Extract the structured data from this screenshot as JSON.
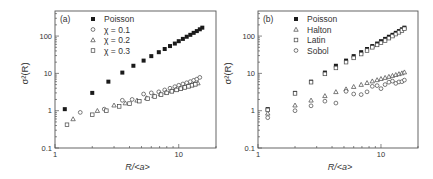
{
  "chart_data": [
    {
      "type": "scatter",
      "panel_label": "(a)",
      "xlabel": "R/<a>",
      "ylabel": "σ²(R)",
      "xscale": "log",
      "yscale": "log",
      "xlim": [
        1,
        20
      ],
      "ylim": [
        0.1,
        470
      ],
      "xticks": [
        1,
        10
      ],
      "xtick_labels": [
        "1",
        "10"
      ],
      "yticks": [
        0.1,
        1,
        10,
        100
      ],
      "ytick_labels": [
        "0.1",
        "1",
        "10",
        "100"
      ],
      "grid": false,
      "legend_position": "upper left",
      "series": [
        {
          "name": "Poisson",
          "marker": "filled-square",
          "x": [
            1.2,
            2.0,
            2.7,
            3.5,
            4.3,
            5.2,
            6.0,
            6.9,
            7.7,
            8.5,
            9.3,
            10.0,
            10.8,
            11.6,
            12.4,
            13.2,
            14.0,
            14.8,
            15.5
          ],
          "y": [
            1.1,
            3.0,
            6.0,
            10.5,
            16,
            22,
            29,
            37,
            45,
            54,
            63,
            73,
            84,
            96,
            108,
            122,
            136,
            152,
            168
          ]
        },
        {
          "name": "χ = 0.1",
          "marker": "open-circle",
          "x": [
            1.6,
            2.5,
            3.5,
            4.2,
            5.2,
            6.0,
            6.9,
            7.7,
            8.5,
            9.3,
            10.0,
            10.8,
            11.6,
            12.4,
            13.2,
            14.0,
            14.8
          ],
          "y": [
            0.9,
            1.1,
            1.9,
            2.0,
            2.8,
            3.0,
            3.2,
            3.6,
            4.0,
            4.4,
            4.8,
            5.2,
            5.6,
            6.0,
            6.5,
            7.0,
            7.8
          ]
        },
        {
          "name": "χ = 0.2",
          "marker": "open-triangle",
          "x": [
            1.4,
            2.2,
            3.0,
            3.7,
            4.6,
            5.5,
            6.3,
            7.1,
            7.9,
            8.7,
            9.5,
            10.3,
            11.1,
            11.9,
            12.7,
            13.5,
            14.3
          ],
          "y": [
            0.6,
            1.0,
            1.4,
            1.6,
            1.9,
            2.2,
            2.5,
            2.8,
            3.1,
            3.4,
            3.7,
            4.0,
            4.3,
            4.6,
            4.9,
            5.2,
            5.5
          ]
        },
        {
          "name": "χ = 0.3",
          "marker": "open-square",
          "x": [
            1.25,
            2.0,
            2.6,
            3.3,
            4.0,
            4.8,
            5.6,
            6.4,
            7.2,
            8.0,
            8.8,
            9.6,
            10.4,
            11.2,
            12.0,
            12.8,
            13.6
          ],
          "y": [
            0.42,
            0.78,
            1.0,
            1.3,
            1.55,
            1.8,
            2.1,
            2.4,
            2.7,
            3.0,
            3.3,
            3.6,
            3.9,
            4.2,
            4.5,
            4.8,
            5.1
          ]
        }
      ]
    },
    {
      "type": "scatter",
      "panel_label": "(b)",
      "xlabel": "R/<a>",
      "ylabel": "σ²(R)",
      "xscale": "log",
      "yscale": "log",
      "xlim": [
        1,
        20
      ],
      "ylim": [
        0.1,
        470
      ],
      "xticks": [
        1,
        10
      ],
      "xtick_labels": [
        "1",
        "10"
      ],
      "yticks": [
        0.1,
        1,
        10,
        100
      ],
      "ytick_labels": [
        "0.1",
        "1",
        "10",
        "100"
      ],
      "grid": false,
      "legend_position": "upper left",
      "series": [
        {
          "name": "Poisson",
          "marker": "filled-square",
          "x": [
            1.2,
            2.0,
            2.7,
            3.5,
            4.3,
            5.2,
            6.0,
            6.9,
            7.7,
            8.5,
            9.3,
            10.0,
            10.8,
            11.6,
            12.4,
            13.2,
            14.0,
            14.8,
            15.5
          ],
          "y": [
            1.1,
            3.0,
            6.0,
            10.5,
            16,
            22,
            29,
            37,
            45,
            54,
            63,
            73,
            84,
            96,
            108,
            122,
            136,
            152,
            168
          ]
        },
        {
          "name": "Halton",
          "marker": "open-triangle",
          "x": [
            1.2,
            2.0,
            2.7,
            3.5,
            4.3,
            5.2,
            6.0,
            6.9,
            7.7,
            8.5,
            9.3,
            10.0,
            10.8,
            11.6,
            12.4,
            13.2,
            14.0,
            14.8,
            15.5
          ],
          "y": [
            0.85,
            1.4,
            1.9,
            2.5,
            3.2,
            3.8,
            4.4,
            5.0,
            5.6,
            6.2,
            6.7,
            7.2,
            7.7,
            8.2,
            8.7,
            9.2,
            9.7,
            10.2,
            10.8
          ]
        },
        {
          "name": "Latin",
          "marker": "open-square",
          "x": [
            1.2,
            2.0,
            2.7,
            3.5,
            4.3,
            5.2,
            6.0,
            6.9,
            7.7,
            8.5,
            9.3,
            10.0,
            10.8,
            11.6,
            12.4,
            13.2,
            14.0,
            14.8,
            15.5
          ],
          "y": [
            1.05,
            2.9,
            5.8,
            9.7,
            14,
            20,
            26,
            33,
            41,
            50,
            58,
            66,
            76,
            88,
            100,
            113,
            126,
            141,
            157
          ]
        },
        {
          "name": "Sobol",
          "marker": "open-circle",
          "x": [
            1.2,
            2.0,
            2.7,
            3.5,
            4.3,
            5.2,
            6.0,
            6.9,
            7.7,
            8.5,
            9.3,
            10.0,
            10.8,
            11.6,
            12.4,
            13.2,
            14.0,
            14.8,
            15.5
          ],
          "y": [
            0.65,
            1.0,
            1.35,
            1.8,
            1.6,
            3.3,
            2.8,
            2.7,
            3.2,
            4.5,
            4.7,
            3.9,
            5.0,
            5.8,
            6.2,
            5.4,
            5.9,
            6.0,
            6.6
          ]
        }
      ]
    }
  ],
  "panels": [
    {
      "label": "(a)",
      "legend": [
        "Poisson",
        "χ = 0.1",
        "χ = 0.2",
        "χ = 0.3"
      ],
      "xlabel": "R/<a>",
      "ylabel": "σ²(R)"
    },
    {
      "label": "(b)",
      "legend": [
        "Poisson",
        "Halton",
        "Latin",
        "Sobol"
      ],
      "xlabel": "R/<a>",
      "ylabel": "σ²(R)"
    }
  ],
  "layout": {
    "panels_px": [
      {
        "left": 55,
        "right": 216,
        "top": 11,
        "bottom": 148
      },
      {
        "left": 258,
        "right": 418,
        "top": 11,
        "bottom": 148
      }
    ]
  }
}
